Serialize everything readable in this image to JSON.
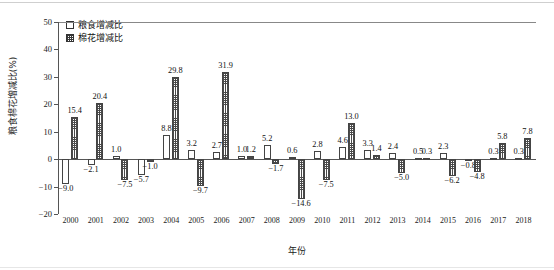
{
  "chart_data": {
    "type": "bar",
    "title": "",
    "xlabel": "年份",
    "ylabel": "粮食棉花增减比(%)",
    "ylim": [
      -20,
      50
    ],
    "yticks": [
      50,
      40,
      30,
      20,
      10,
      0,
      -10,
      -20
    ],
    "grid": false,
    "legend_position": "top-left",
    "categories": [
      "2000",
      "2001",
      "2002",
      "2003",
      "2004",
      "2005",
      "2006",
      "2007",
      "2008",
      "2009",
      "2010",
      "2011",
      "2012",
      "2013",
      "2014",
      "2015",
      "2016",
      "2017",
      "2018"
    ],
    "series": [
      {
        "name": "粮食增减比",
        "pattern": "hollow",
        "values": [
          -9.0,
          -2.1,
          1.0,
          -5.7,
          8.8,
          3.2,
          2.7,
          1.0,
          5.2,
          0.6,
          2.8,
          4.6,
          3.3,
          2.4,
          0.5,
          2.3,
          -0.8,
          0.3,
          0.3
        ]
      },
      {
        "name": "棉花增减比",
        "pattern": "grid-hatch",
        "values": [
          15.4,
          20.4,
          -7.5,
          -1.0,
          29.8,
          -9.7,
          31.9,
          1.2,
          -1.7,
          -14.6,
          -7.5,
          13.0,
          1.4,
          -5.0,
          0.3,
          -6.2,
          -4.8,
          5.8,
          7.8
        ]
      }
    ],
    "value_labels": [
      {
        "year": "2000",
        "s1": "−9.0",
        "s2": "15.4"
      },
      {
        "year": "2001",
        "s1": "−2.1",
        "s2": "20.4"
      },
      {
        "year": "2002",
        "s1": "1.0",
        "s2": "−7.5"
      },
      {
        "year": "2003",
        "s1": "−5.7",
        "s2": "−1.0"
      },
      {
        "year": "2004",
        "s1": "8.8",
        "s2": "29.8"
      },
      {
        "year": "2005",
        "s1": "3.2",
        "s2": "−9.7"
      },
      {
        "year": "2006",
        "s1": "2.7",
        "s2": "31.9"
      },
      {
        "year": "2007",
        "s1": "1.0",
        "s2": "1.2"
      },
      {
        "year": "2008",
        "s1": "5.2",
        "s2": "−1.7"
      },
      {
        "year": "2009",
        "s1": "0.6",
        "s2": "−14.6"
      },
      {
        "year": "2010",
        "s1": "2.8",
        "s2": "−7.5"
      },
      {
        "year": "2011",
        "s1": "4.6",
        "s2": "13.0"
      },
      {
        "year": "2012",
        "s1": "3.3",
        "s2": "1.4"
      },
      {
        "year": "2013",
        "s1": "2.4",
        "s2": "−5.0"
      },
      {
        "year": "2014",
        "s1": "0.5",
        "s2": "0.3"
      },
      {
        "year": "2015",
        "s1": "2.3",
        "s2": "−6.2"
      },
      {
        "year": "2016",
        "s1": "−0.8",
        "s2": "−4.8"
      },
      {
        "year": "2017",
        "s1": "0.3",
        "s2": "5.8"
      },
      {
        "year": "2018",
        "s1": "0.3",
        "s2": "7.8"
      }
    ]
  },
  "legend": {
    "items": [
      {
        "label": "粮食增减比"
      },
      {
        "label": "棉花增减比"
      }
    ]
  },
  "colors": {
    "axis": "#555555",
    "bar_outline": "#444444",
    "series1_fill": "#ffffff",
    "series2_hatch": "#4a4a4a",
    "text": "#1a1a1a"
  }
}
